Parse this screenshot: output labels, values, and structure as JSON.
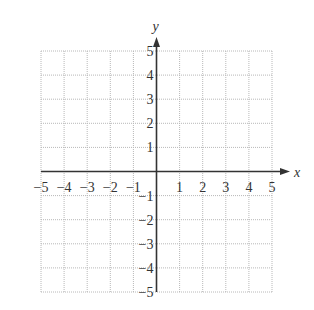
{
  "chart_data": {
    "type": "scatter",
    "title": "",
    "xlabel": "x",
    "ylabel": "y",
    "xlim": [
      -5,
      5
    ],
    "ylim": [
      -5,
      5
    ],
    "grid": true,
    "grid_style": "dotted",
    "x_ticks": [
      -5,
      -4,
      -3,
      -2,
      -1,
      1,
      2,
      3,
      4,
      5
    ],
    "y_ticks": [
      5,
      4,
      3,
      2,
      1,
      -1,
      -2,
      -3,
      -4,
      -5
    ],
    "x_tick_labels": [
      "−5",
      "−4",
      "−3",
      "−2",
      "−1",
      "1",
      "2",
      "3",
      "4",
      "5"
    ],
    "y_tick_labels": [
      "5",
      "4",
      "3",
      "2",
      "1",
      "−1",
      "−2",
      "−3",
      "−4",
      "−5"
    ],
    "series": []
  },
  "colors": {
    "axis": "#333333",
    "grid": "#b8b8b8"
  }
}
